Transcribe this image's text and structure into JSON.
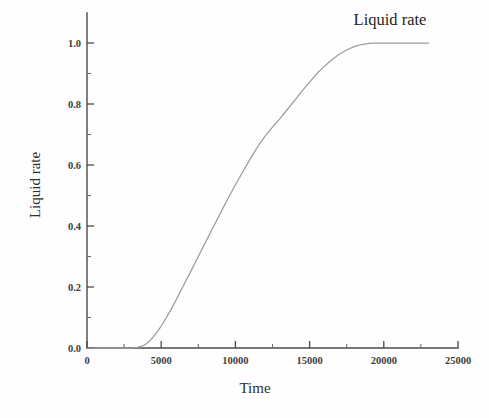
{
  "chart_data": {
    "type": "line",
    "title": "Liquid rate",
    "title_position": "top-right",
    "xlabel": "Time",
    "ylabel": "Liquid rate",
    "xlim": [
      0,
      25000
    ],
    "ylim": [
      0.0,
      1.0
    ],
    "grid": false,
    "legend": "none",
    "x_ticks_major": [
      0,
      5000,
      10000,
      15000,
      20000,
      25000
    ],
    "x_tick_labels": [
      "0",
      "5000",
      "10000",
      "15000",
      "20000",
      "25000"
    ],
    "x_ticks_minor": [
      2500,
      7500,
      12500,
      17500,
      22500
    ],
    "y_ticks_major": [
      0.0,
      0.2,
      0.4,
      0.6,
      0.8,
      1.0
    ],
    "y_tick_labels": [
      "0.0",
      "0.2",
      "0.4",
      "0.6",
      "0.8",
      "1.0"
    ],
    "y_ticks_minor": [
      0.1,
      0.3,
      0.5,
      0.7,
      0.9
    ],
    "series": [
      {
        "name": "Liquid rate",
        "color": "#9d9d9d",
        "x": [
          0,
          500,
          1000,
          1500,
          2000,
          2500,
          3000,
          3400,
          3800,
          4000,
          4200,
          4500,
          4800,
          5000,
          5300,
          5600,
          6000,
          6500,
          7000,
          7500,
          8000,
          8500,
          9000,
          9500,
          10000,
          10500,
          11000,
          11500,
          12000,
          12500,
          13000,
          13500,
          14000,
          14500,
          15000,
          15500,
          16000,
          16500,
          17000,
          17500,
          18000,
          18500,
          19000,
          19400,
          19800,
          20200,
          21000,
          22000,
          23000
        ],
        "y": [
          0.0,
          0.0,
          0.0,
          0.0,
          0.0,
          0.0,
          0.0,
          0.002,
          0.008,
          0.014,
          0.022,
          0.038,
          0.058,
          0.072,
          0.096,
          0.121,
          0.157,
          0.205,
          0.252,
          0.3,
          0.348,
          0.396,
          0.443,
          0.49,
          0.535,
          0.578,
          0.62,
          0.66,
          0.695,
          0.724,
          0.752,
          0.782,
          0.812,
          0.843,
          0.872,
          0.9,
          0.924,
          0.945,
          0.963,
          0.977,
          0.988,
          0.995,
          0.999,
          1.0,
          1.0,
          1.0,
          1.0,
          1.0,
          1.0
        ]
      }
    ]
  },
  "axis": {
    "y_title": "Liquid rate",
    "x_title": "Time"
  },
  "header": {
    "title": "Liquid rate"
  }
}
